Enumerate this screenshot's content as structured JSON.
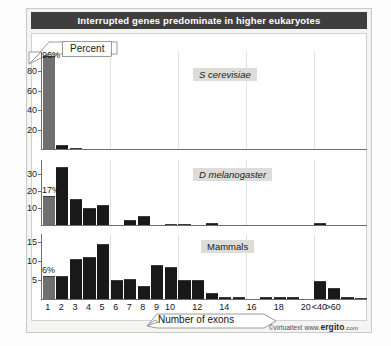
{
  "figure": {
    "title": "Interrupted genes predominate in higher eukaryotes",
    "y_axis_banner": "Percent",
    "x_axis_banner": "Number of exons",
    "credit_prefix": "©virtualtext",
    "credit_www": "www.",
    "credit_brand": "ergito",
    "credit_tld": ".com"
  },
  "chart_data": {
    "type": "bar",
    "title": "Interrupted genes predominate in higher eukaryotes",
    "xlabel": "Number of exons",
    "ylabel": "Percent",
    "grid": true,
    "legend": "none",
    "categories": [
      "1",
      "2",
      "3",
      "4",
      "5",
      "6",
      "7",
      "8",
      "9",
      "10",
      "11",
      "12",
      "13",
      "14",
      "15",
      "16",
      "17",
      "18",
      "19",
      "20",
      "<40",
      ">60"
    ],
    "tick_labels": [
      "1",
      "2",
      "3",
      "4",
      "5",
      "6",
      "7",
      "8",
      "9",
      "10",
      "12",
      "14",
      "16",
      "18",
      "20",
      "<40",
      ">60"
    ],
    "panels": [
      {
        "name": "S cerevisiae",
        "label": "S  cerevisiae",
        "ylim": [
          0,
          100
        ],
        "yticks": [
          20,
          40,
          60,
          80
        ],
        "callout": "96%",
        "callout_category": "1",
        "values": [
          96,
          4,
          1,
          0,
          0,
          0,
          0,
          0,
          0,
          0,
          0,
          0,
          0,
          0,
          0,
          0,
          0,
          0,
          0,
          0,
          0,
          0
        ]
      },
      {
        "name": "D melanogaster",
        "label": "D  melanogaster",
        "ylim": [
          0,
          38
        ],
        "yticks": [
          10,
          20,
          30
        ],
        "callout": "17%",
        "callout_category": "1",
        "values": [
          17,
          34,
          15,
          10,
          11.5,
          0,
          3,
          5.5,
          0,
          0.7,
          0.8,
          0,
          1,
          0,
          0,
          0,
          0,
          0,
          0,
          0,
          1.2,
          0
        ]
      },
      {
        "name": "Mammals",
        "label": "Mammals",
        "ylim": [
          0,
          17
        ],
        "yticks": [
          5,
          10,
          15
        ],
        "callout": "6%",
        "callout_category": "1",
        "values": [
          6,
          6.1,
          10.5,
          11,
          14.5,
          5,
          5.3,
          3.5,
          9,
          8.3,
          5,
          5.1,
          1.5,
          0.5,
          0.4,
          0,
          0.5,
          0.5,
          0.4,
          0,
          4.6,
          2.8,
          0.5,
          0.3
        ]
      }
    ]
  }
}
